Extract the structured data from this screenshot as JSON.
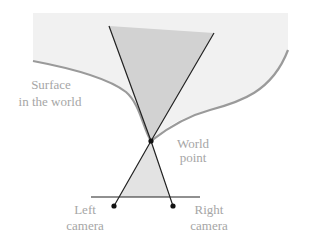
{
  "diagram": {
    "type": "stereo-triangulation",
    "labels": {
      "surface_line1": "Surface",
      "surface_line2": "in the world",
      "world_point_line1": "World",
      "world_point_line2": "point",
      "left_camera_line1": "Left",
      "left_camera_line2": "camera",
      "right_camera_line1": "Right",
      "right_camera_line2": "camera"
    },
    "colors": {
      "background_region": "#f1f1f1",
      "surface_curve": "#9a9a9a",
      "upper_cone_fill": "#d4d4d4",
      "lower_cone_fill": "#e3e3e3",
      "rays": "#222222",
      "points": "#111111",
      "label_text": "#a6a6a6"
    },
    "points": {
      "world_point": [
        151,
        141
      ],
      "left_camera": [
        114,
        206
      ],
      "right_camera": [
        173,
        206
      ]
    },
    "image_plane": {
      "x1": 91,
      "x2": 200,
      "y": 197
    }
  }
}
